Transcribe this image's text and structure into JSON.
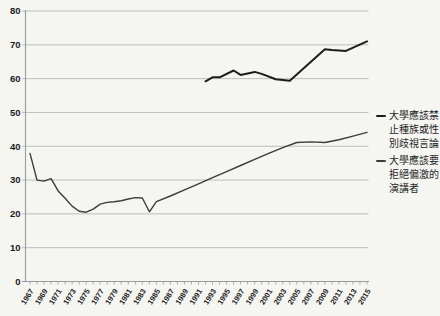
{
  "chart_data": {
    "type": "line",
    "title": "",
    "xlabel": "",
    "ylabel": "",
    "xlim": [
      1967,
      2015
    ],
    "ylim": [
      0,
      80
    ],
    "grid": "horizontal",
    "legend_position": "right",
    "y_tick_labels": [
      "0",
      "10",
      "20",
      "30",
      "40",
      "50",
      "60",
      "70",
      "80"
    ],
    "x_tick_labels": [
      "1967",
      "1969",
      "1971",
      "1973",
      "1975",
      "1977",
      "1979",
      "1981",
      "1983",
      "1985",
      "1987",
      "1989",
      "1991",
      "1993",
      "1995",
      "1997",
      "1999",
      "2001",
      "2003",
      "2005",
      "2007",
      "2009",
      "2011",
      "2013",
      "2015"
    ],
    "colors": {
      "background": "#f5f5f2",
      "gridline": "#b7b7b7",
      "axis": "#9b9b9b",
      "tick_label": "#1c1c1c"
    },
    "series": [
      {
        "name": "大學應該禁止種族或性別歧視言論",
        "legend_lines": [
          "大學應該禁",
          "止種族或性",
          "別歧視言論"
        ],
        "color": "#1c1c1c",
        "width": 2,
        "points": [
          [
            1992,
            59.2
          ],
          [
            1993,
            60.4
          ],
          [
            1994,
            60.4
          ],
          [
            1996,
            62.4
          ],
          [
            1997,
            61.1
          ],
          [
            1999,
            62
          ],
          [
            2000,
            61.4
          ],
          [
            2002,
            59.8
          ],
          [
            2004,
            59.4
          ],
          [
            2009,
            68.7
          ],
          [
            2010,
            68.5
          ],
          [
            2012,
            68.2
          ],
          [
            2015,
            71
          ]
        ]
      },
      {
        "name": "大學應該要拒絕偏激的演講者",
        "legend_lines": [
          "大學應該要",
          "拒絕偏激的",
          "演講者"
        ],
        "color": "#3c3c3c",
        "width": 1.4,
        "points": [
          [
            1967,
            37.9
          ],
          [
            1968,
            30
          ],
          [
            1969,
            29.7
          ],
          [
            1970,
            30.4
          ],
          [
            1971,
            26.8
          ],
          [
            1972,
            24.6
          ],
          [
            1973,
            22.3
          ],
          [
            1974,
            20.8
          ],
          [
            1975,
            20.5
          ],
          [
            1976,
            21.4
          ],
          [
            1977,
            22.9
          ],
          [
            1978,
            23.4
          ],
          [
            1979,
            23.6
          ],
          [
            1980,
            23.9
          ],
          [
            1981,
            24.4
          ],
          [
            1982,
            24.8
          ],
          [
            1983,
            24.7
          ],
          [
            1984,
            20.6
          ],
          [
            1985,
            23.6
          ],
          [
            1987,
            25.3
          ],
          [
            1989,
            27.1
          ],
          [
            1991,
            28.9
          ],
          [
            1993,
            30.7
          ],
          [
            1995,
            32.5
          ],
          [
            1997,
            34.3
          ],
          [
            1999,
            36.1
          ],
          [
            2001,
            37.9
          ],
          [
            2003,
            39.6
          ],
          [
            2005,
            41.1
          ],
          [
            2007,
            41.3
          ],
          [
            2009,
            41.1
          ],
          [
            2011,
            41.9
          ],
          [
            2013,
            43
          ],
          [
            2015,
            44.1
          ]
        ]
      }
    ]
  }
}
